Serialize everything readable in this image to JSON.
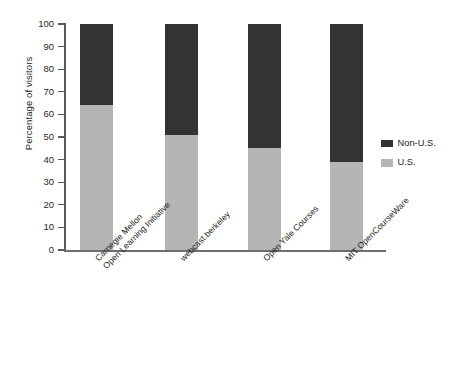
{
  "chart_data": {
    "type": "bar",
    "subtype": "stacked-100-percent",
    "title": "",
    "xlabel": "",
    "ylabel": "Percentage of visitors",
    "ylim": [
      0,
      100
    ],
    "ytick_step": 10,
    "yticks": [
      100,
      90,
      80,
      70,
      60,
      50,
      40,
      30,
      20,
      10,
      0
    ],
    "grid": false,
    "legend_position": "right",
    "categories": [
      "Carnegie Mellon Open Learning Initiative",
      "webcast.berkeley",
      "Open Yale Courses",
      "MIT OpenCourseWare"
    ],
    "category_lines": [
      [
        "Carnegie Mellon",
        "Open Learning Initiative"
      ],
      [
        "webcast.berkeley"
      ],
      [
        "Open Yale Courses"
      ],
      [
        "MIT OpenCourseWare"
      ]
    ],
    "series": [
      {
        "name": "U.S.",
        "color": "#b5b5b5",
        "values": [
          64,
          51,
          45,
          39
        ]
      },
      {
        "name": "Non-U.S.",
        "color": "#333333",
        "values": [
          36,
          49,
          55,
          61
        ]
      }
    ]
  },
  "legend": {
    "items": [
      {
        "label": "Non-U.S.",
        "color": "#333333"
      },
      {
        "label": "U.S.",
        "color": "#b5b5b5"
      }
    ]
  },
  "axis": {
    "y_title": "Percentage of visitors",
    "y_labels": [
      "100",
      "90",
      "80",
      "70",
      "60",
      "50",
      "40",
      "30",
      "20",
      "10",
      "0"
    ]
  },
  "colors": {
    "non_us": "#333333",
    "us": "#b5b5b5",
    "axis": "#6d6e71",
    "text": "#231f20",
    "background": "#ffffff"
  }
}
